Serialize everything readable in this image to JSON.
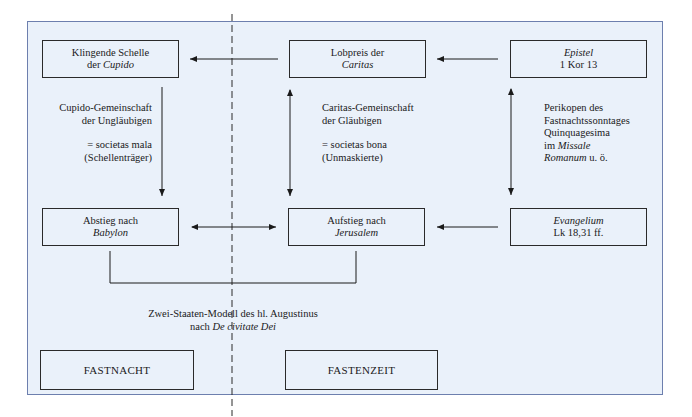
{
  "diagram": {
    "nodes": {
      "klingende_schelle": {
        "line1": "Klingende Schelle",
        "line2_prefix": "der ",
        "line2_italic": "Cupido"
      },
      "lobpreis": {
        "line1": "Lobpreis der",
        "line2_italic": "Caritas"
      },
      "epistel": {
        "line1_italic": "Epistel",
        "line2": "1 Kor 13"
      },
      "abstieg": {
        "line1": "Abstieg nach",
        "line2_italic": "Babylon"
      },
      "aufstieg": {
        "line1": "Aufstieg nach",
        "line2_italic": "Jerusalem"
      },
      "evangelium": {
        "line1_italic": "Evangelium",
        "line2": "Lk 18,31 ff."
      },
      "fastnacht": {
        "label": "FASTNACHT"
      },
      "fastenzeit": {
        "label": "FASTENZEIT"
      }
    },
    "labels": {
      "cupido_gemeinschaft": {
        "line1": "Cupido-Gemeinschaft",
        "line2": "der Ungläubigen",
        "line3": "= societas mala",
        "line4": "(Schellenträger)"
      },
      "caritas_gemeinschaft": {
        "line1": "Caritas-Gemeinschaft",
        "line2": "der Gläubigen",
        "line3": "= societas bona",
        "line4": "(Unmaskierte)"
      },
      "perikopen": {
        "line1": "Perikopen des",
        "line2": "Fastnachtssonntages",
        "line3": "Quinquagesima",
        "line4_prefix": "im ",
        "line4_italic": "Missale",
        "line5_italic": "Romanum",
        "line5_suffix": " u. ö."
      },
      "zwei_staaten": {
        "line1": "Zwei-Staaten-Modell des hl. Augustinus",
        "line2_prefix": "nach ",
        "line2_italic": "De civitate Dei"
      }
    },
    "edges": [
      {
        "from": "lobpreis",
        "to": "klingende_schelle",
        "type": "arrow"
      },
      {
        "from": "epistel",
        "to": "lobpreis",
        "type": "arrow"
      },
      {
        "from": "klingende_schelle",
        "to": "abstieg",
        "type": "arrow"
      },
      {
        "from": "lobpreis",
        "to": "aufstieg",
        "type": "double-arrow"
      },
      {
        "from": "epistel",
        "to": "evangelium",
        "type": "double-arrow"
      },
      {
        "from": "abstieg",
        "to": "aufstieg",
        "type": "double-arrow"
      },
      {
        "from": "evangelium",
        "to": "aufstieg",
        "type": "arrow"
      },
      {
        "from": "abstieg",
        "to": "aufstieg",
        "type": "bracket",
        "label": "zwei_staaten"
      }
    ],
    "colors": {
      "background": "#eaf1fa",
      "frame_border": "#6d7fae",
      "ink": "#1a1a1a"
    }
  }
}
